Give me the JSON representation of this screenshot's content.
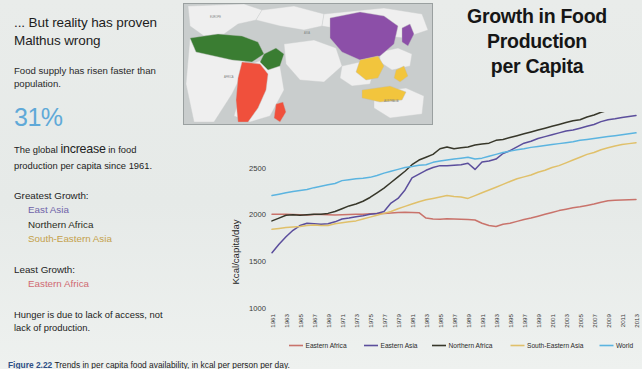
{
  "left_panel": {
    "headline": "... But reality has proven Malthus wrong",
    "subtext": "Food supply has risen faster than population.",
    "big_number": "31%",
    "big_number_color": "#5fa9d8",
    "paragraph_pre": "The global ",
    "paragraph_emph": "increase",
    "paragraph_post": " in food production per capita since 1961.",
    "greatest_growth_label": "Greatest Growth:",
    "greatest_growth_items": [
      {
        "label": "East Asia",
        "color": "#6f63a8"
      },
      {
        "label": "Northern Africa",
        "color": "#2b2b22"
      },
      {
        "label": "South-Eastern Asia",
        "color": "#c4a14a"
      }
    ],
    "least_growth_label": "Least Growth:",
    "least_growth_items": [
      {
        "label": "Eastern Africa",
        "color": "#d06a72"
      }
    ],
    "closing": "Hunger is due to lack of access, not lack of production."
  },
  "map": {
    "name": "world-choropleth-map",
    "ocean_color": "#c9cdcd",
    "land_color": "#efefef",
    "regions": [
      {
        "name": "Northern Africa",
        "color": "#3a7d32"
      },
      {
        "name": "Eastern Africa",
        "color": "#f0503c"
      },
      {
        "name": "East Asia",
        "color": "#8c4fa8"
      },
      {
        "name": "South-Eastern Asia",
        "color": "#f2c53d"
      }
    ]
  },
  "title": {
    "line1": "Growth in Food",
    "line2": "Production",
    "line3": "per Capita"
  },
  "caption": {
    "figure_number": "Figure 2.22",
    "body": "  Trends in per capita food availability, in kcal per person per day."
  },
  "chart_data": {
    "type": "line",
    "title": "Growth in Food Production per Capita",
    "xlabel": "",
    "ylabel": "Kcal/capita/day",
    "ylim": [
      1000,
      3050
    ],
    "yticks": [
      1000,
      1500,
      2000,
      2500
    ],
    "grid": false,
    "legend_position": "bottom",
    "x": [
      1961,
      1962,
      1963,
      1964,
      1965,
      1966,
      1967,
      1968,
      1969,
      1970,
      1971,
      1972,
      1973,
      1974,
      1975,
      1976,
      1977,
      1978,
      1979,
      1980,
      1981,
      1982,
      1983,
      1984,
      1985,
      1986,
      1987,
      1988,
      1989,
      1990,
      1991,
      1992,
      1993,
      1994,
      1995,
      1996,
      1997,
      1998,
      1999,
      2000,
      2001,
      2002,
      2003,
      2004,
      2005,
      2006,
      2007,
      2008,
      2009,
      2010,
      2011,
      2012,
      2013
    ],
    "xtick_labels": [
      "1961",
      "1963",
      "1965",
      "1967",
      "1969",
      "1971",
      "1973",
      "1975",
      "1977",
      "1979",
      "1981",
      "1983",
      "1985",
      "1987",
      "1989",
      "1991",
      "1993",
      "1995",
      "1997",
      "1999",
      "2001",
      "2003",
      "2005",
      "2007",
      "2009",
      "2011",
      "2013"
    ],
    "series": [
      {
        "name": "Eastern Africa",
        "color": "#c9736b",
        "values": [
          2000,
          2000,
          2000,
          1998,
          1995,
          1993,
          1998,
          1997,
          1996,
          1993,
          1995,
          1998,
          2000,
          2002,
          2005,
          2008,
          2010,
          2015,
          2020,
          2022,
          2020,
          2018,
          1960,
          1950,
          1948,
          1952,
          1950,
          1948,
          1944,
          1940,
          1905,
          1880,
          1870,
          1895,
          1905,
          1925,
          1945,
          1960,
          1980,
          2000,
          2020,
          2040,
          2055,
          2070,
          2080,
          2095,
          2110,
          2130,
          2145,
          2150,
          2152,
          2155,
          2158
        ]
      },
      {
        "name": "Eastern Asia",
        "color": "#5b4e9c",
        "values": [
          1590,
          1680,
          1760,
          1830,
          1880,
          1905,
          1900,
          1895,
          1900,
          1920,
          1950,
          1960,
          1975,
          1985,
          2000,
          2010,
          2030,
          2120,
          2170,
          2260,
          2390,
          2430,
          2470,
          2500,
          2520,
          2520,
          2525,
          2530,
          2545,
          2480,
          2560,
          2570,
          2590,
          2650,
          2680,
          2720,
          2760,
          2780,
          2810,
          2830,
          2850,
          2870,
          2890,
          2900,
          2920,
          2940,
          2960,
          2990,
          3010,
          3020,
          3035,
          3045,
          3055
        ]
      },
      {
        "name": "Northern Africa",
        "color": "#37372a",
        "values": [
          1930,
          1960,
          1990,
          1995,
          1990,
          1995,
          2000,
          2000,
          2010,
          2030,
          2060,
          2090,
          2110,
          2140,
          2180,
          2230,
          2280,
          2340,
          2400,
          2460,
          2530,
          2580,
          2610,
          2640,
          2700,
          2720,
          2700,
          2710,
          2720,
          2740,
          2750,
          2760,
          2790,
          2800,
          2820,
          2840,
          2860,
          2880,
          2900,
          2920,
          2940,
          2960,
          2980,
          3000,
          3010,
          3040,
          3060,
          3090,
          3110,
          3130,
          3150,
          3170,
          3185
        ]
      },
      {
        "name": "South-Eastern Asia",
        "color": "#e0c06a",
        "values": [
          1840,
          1850,
          1860,
          1865,
          1870,
          1880,
          1885,
          1880,
          1880,
          1900,
          1910,
          1920,
          1930,
          1950,
          1970,
          1990,
          2010,
          2030,
          2060,
          2085,
          2110,
          2135,
          2155,
          2170,
          2185,
          2200,
          2190,
          2185,
          2170,
          2200,
          2230,
          2260,
          2290,
          2320,
          2350,
          2380,
          2400,
          2420,
          2450,
          2470,
          2500,
          2520,
          2550,
          2580,
          2610,
          2640,
          2660,
          2690,
          2710,
          2730,
          2745,
          2755,
          2765
        ]
      },
      {
        "name": "World",
        "color": "#5bb4e0",
        "values": [
          2200,
          2215,
          2230,
          2245,
          2255,
          2265,
          2285,
          2300,
          2315,
          2330,
          2360,
          2370,
          2380,
          2385,
          2395,
          2415,
          2440,
          2460,
          2480,
          2500,
          2510,
          2525,
          2530,
          2555,
          2570,
          2580,
          2590,
          2600,
          2610,
          2590,
          2600,
          2620,
          2640,
          2660,
          2675,
          2690,
          2700,
          2715,
          2725,
          2735,
          2745,
          2755,
          2765,
          2775,
          2790,
          2800,
          2810,
          2820,
          2830,
          2840,
          2850,
          2860,
          2870
        ]
      }
    ]
  }
}
